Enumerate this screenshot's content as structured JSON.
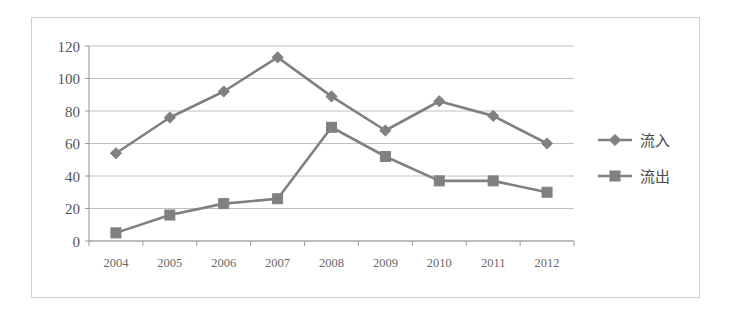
{
  "chart_data": {
    "type": "line",
    "title": "",
    "subtitle": "",
    "xlabel": "",
    "ylabel": "",
    "categories": [
      "2004",
      "2005",
      "2006",
      "2007",
      "2008",
      "2009",
      "2010",
      "2011",
      "2012"
    ],
    "series": [
      {
        "name": "流入",
        "marker": "diamond",
        "color": "#808080",
        "values": [
          54,
          76,
          92,
          113,
          89,
          68,
          86,
          77,
          60
        ]
      },
      {
        "name": "流出",
        "marker": "square",
        "color": "#808080",
        "values": [
          5,
          16,
          23,
          26,
          70,
          52,
          37,
          37,
          30
        ]
      }
    ],
    "ylim": [
      0,
      120
    ],
    "ytick_step": 20,
    "yticks": [
      "0",
      "20",
      "40",
      "60",
      "80",
      "100",
      "120"
    ],
    "grid": "horizontal",
    "legend_position": "right",
    "plot_background": "#ffffff",
    "gridline_color": "#b8b8b8",
    "axis_color": "#9a9a9a",
    "border_color": "#cfcfcf"
  },
  "legend": {
    "entries": [
      {
        "label": "流入",
        "marker": "diamond-marker"
      },
      {
        "label": "流出",
        "marker": "square-marker"
      }
    ]
  }
}
